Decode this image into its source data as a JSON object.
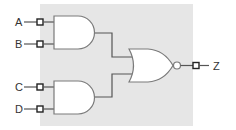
{
  "diagram": {
    "type": "logic-circuit",
    "background_color": "#e6e6e6",
    "inputs": [
      {
        "label": "A",
        "gate": "and-1"
      },
      {
        "label": "B",
        "gate": "and-1"
      },
      {
        "label": "C",
        "gate": "and-2"
      },
      {
        "label": "D",
        "gate": "and-2"
      }
    ],
    "gates": [
      {
        "id": "and-1",
        "type": "AND",
        "inputs": [
          "A",
          "B"
        ]
      },
      {
        "id": "and-2",
        "type": "AND",
        "inputs": [
          "C",
          "D"
        ]
      },
      {
        "id": "nor-1",
        "type": "NOR",
        "inputs": [
          "and-1",
          "and-2"
        ]
      }
    ],
    "output": {
      "label": "Z",
      "gate": "nor-1"
    },
    "expression": "Z = NOT((A AND B) OR (C AND D))"
  }
}
